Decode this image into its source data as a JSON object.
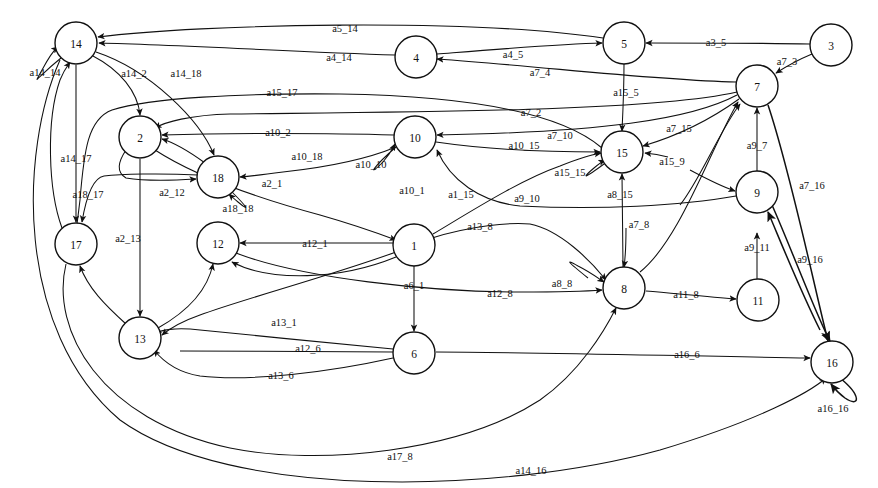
{
  "diagram": {
    "type": "directed-graph",
    "background_color": "#ffffff",
    "stroke_color": "#111111",
    "node_radius": 21,
    "nodes": [
      {
        "id": "14",
        "label": "14",
        "x": 76,
        "y": 43
      },
      {
        "id": "4",
        "label": "4",
        "x": 416,
        "y": 57
      },
      {
        "id": "5",
        "label": "5",
        "x": 624,
        "y": 43
      },
      {
        "id": "3",
        "label": "3",
        "x": 831,
        "y": 45
      },
      {
        "id": "7",
        "label": "7",
        "x": 757,
        "y": 86
      },
      {
        "id": "2",
        "label": "2",
        "x": 140,
        "y": 137
      },
      {
        "id": "10",
        "label": "10",
        "x": 415,
        "y": 137
      },
      {
        "id": "15",
        "label": "15",
        "x": 622,
        "y": 152
      },
      {
        "id": "18",
        "label": "18",
        "x": 218,
        "y": 177
      },
      {
        "id": "9",
        "label": "9",
        "x": 757,
        "y": 192
      },
      {
        "id": "12",
        "label": "12",
        "x": 218,
        "y": 243
      },
      {
        "id": "1",
        "label": "1",
        "x": 414,
        "y": 245
      },
      {
        "id": "17",
        "label": "17",
        "x": 76,
        "y": 244
      },
      {
        "id": "8",
        "label": "8",
        "x": 624,
        "y": 288
      },
      {
        "id": "11",
        "label": "11",
        "x": 758,
        "y": 300
      },
      {
        "id": "13",
        "label": "13",
        "x": 140,
        "y": 338
      },
      {
        "id": "6",
        "label": "6",
        "x": 414,
        "y": 353
      },
      {
        "id": "16",
        "label": "16",
        "x": 832,
        "y": 362
      }
    ],
    "edges": [
      {
        "label": "a14_14",
        "from": "14",
        "to": "14",
        "lx": 45,
        "ly": 72
      },
      {
        "label": "a5_14",
        "from": "5",
        "to": "14",
        "lx": 345,
        "ly": 28
      },
      {
        "label": "a4_14",
        "from": "4",
        "to": "14",
        "lx": 339,
        "ly": 57
      },
      {
        "label": "a14_2",
        "from": "14",
        "to": "2",
        "lx": 134,
        "ly": 73
      },
      {
        "label": "a14_18",
        "from": "14",
        "to": "18",
        "lx": 186,
        "ly": 73
      },
      {
        "label": "a14_17",
        "from": "14",
        "to": "17",
        "lx": 76,
        "ly": 158
      },
      {
        "label": "a18_17",
        "from": "18",
        "to": "17",
        "lx": 88,
        "ly": 194
      },
      {
        "label": "a4_5",
        "from": "4",
        "to": "5",
        "lx": 513,
        "ly": 54
      },
      {
        "label": "a7_4",
        "from": "7",
        "to": "4",
        "lx": 540,
        "ly": 72
      },
      {
        "label": "a3_5",
        "from": "3",
        "to": "5",
        "lx": 716,
        "ly": 42
      },
      {
        "label": "a7_3",
        "from": "7",
        "to": "3",
        "lx": 787,
        "ly": 61
      },
      {
        "label": "a15_17",
        "from": "15",
        "to": "17",
        "lx": 282,
        "ly": 92
      },
      {
        "label": "a15_5",
        "from": "15",
        "to": "5",
        "lx": 626,
        "ly": 92
      },
      {
        "label": "a7_2",
        "from": "7",
        "to": "2",
        "lx": 531,
        "ly": 112
      },
      {
        "label": "a10_2",
        "from": "10",
        "to": "2",
        "lx": 278,
        "ly": 132
      },
      {
        "label": "a7_10",
        "from": "7",
        "to": "10",
        "lx": 560,
        "ly": 135
      },
      {
        "label": "a7_15",
        "from": "7",
        "to": "15",
        "lx": 679,
        "ly": 128
      },
      {
        "label": "a10_18",
        "from": "10",
        "to": "18",
        "lx": 307,
        "ly": 156
      },
      {
        "label": "a10_10",
        "from": "10",
        "to": "10",
        "lx": 371,
        "ly": 164
      },
      {
        "label": "a10_15",
        "from": "10",
        "to": "15",
        "lx": 524,
        "ly": 145
      },
      {
        "label": "a15_15",
        "from": "15",
        "to": "15",
        "lx": 570,
        "ly": 172
      },
      {
        "label": "a15_9",
        "from": "15",
        "to": "9",
        "lx": 672,
        "ly": 161
      },
      {
        "label": "a2_12",
        "from": "2",
        "to": "12",
        "lx": 172,
        "ly": 192
      },
      {
        "label": "a2_1",
        "from": "2",
        "to": "1",
        "lx": 272,
        "ly": 183
      },
      {
        "label": "a10_1",
        "from": "10",
        "to": "1",
        "lx": 412,
        "ly": 190
      },
      {
        "label": "a1_15",
        "from": "1",
        "to": "15",
        "lx": 461,
        "ly": 194
      },
      {
        "label": "a9_10",
        "from": "9",
        "to": "10",
        "lx": 527,
        "ly": 198
      },
      {
        "label": "a8_15",
        "from": "8",
        "to": "15",
        "lx": 620,
        "ly": 194
      },
      {
        "label": "a9_7",
        "from": "9",
        "to": "7",
        "lx": 757,
        "ly": 145
      },
      {
        "label": "a7_16",
        "from": "7",
        "to": "16",
        "lx": 812,
        "ly": 185
      },
      {
        "label": "a18_18",
        "from": "18",
        "to": "18",
        "lx": 238,
        "ly": 208
      },
      {
        "label": "a2_13",
        "from": "2",
        "to": "13",
        "lx": 128,
        "ly": 238
      },
      {
        "label": "a13_8",
        "from": "13",
        "to": "8",
        "lx": 480,
        "ly": 226
      },
      {
        "label": "a7_8",
        "from": "7",
        "to": "8",
        "lx": 639,
        "ly": 224
      },
      {
        "label": "a12_1",
        "from": "12",
        "to": "1",
        "lx": 315,
        "ly": 243
      },
      {
        "label": "a9_11",
        "from": "9",
        "to": "11",
        "lx": 757,
        "ly": 247
      },
      {
        "label": "a9_16",
        "from": "9",
        "to": "16",
        "lx": 810,
        "ly": 259
      },
      {
        "label": "a6_1",
        "from": "6",
        "to": "1",
        "lx": 414,
        "ly": 285
      },
      {
        "label": "a8_8",
        "from": "8",
        "to": "8",
        "lx": 562,
        "ly": 283
      },
      {
        "label": "a12_8",
        "from": "12",
        "to": "8",
        "lx": 500,
        "ly": 293
      },
      {
        "label": "a11_8",
        "from": "11",
        "to": "8",
        "lx": 686,
        "ly": 294
      },
      {
        "label": "a13_1",
        "from": "13",
        "to": "1",
        "lx": 284,
        "ly": 322
      },
      {
        "label": "a12_6",
        "from": "12",
        "to": "6",
        "lx": 308,
        "ly": 348
      },
      {
        "label": "a16_6",
        "from": "16",
        "to": "6",
        "lx": 687,
        "ly": 354
      },
      {
        "label": "a13_6",
        "from": "13",
        "to": "6",
        "lx": 281,
        "ly": 375
      },
      {
        "label": "a16_16",
        "from": "16",
        "to": "16",
        "lx": 833,
        "ly": 408
      },
      {
        "label": "a17_8",
        "from": "17",
        "to": "8",
        "lx": 400,
        "ly": 456
      },
      {
        "label": "a14_16",
        "from": "14",
        "to": "16",
        "lx": 531,
        "ly": 470
      }
    ]
  }
}
